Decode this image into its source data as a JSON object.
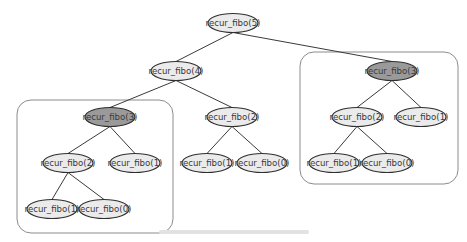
{
  "diagram": {
    "colors": {
      "node_fill": "#ebebeb",
      "node_stroke": "#2f2f2f",
      "highlight_fill": "#9a9a9a",
      "edge": "#3a3a3a",
      "group_stroke": "#8c8c8c"
    },
    "nodes": [
      {
        "id": "n5",
        "label": "recur_fibo(5)",
        "highlight": false
      },
      {
        "id": "n4",
        "label": "recur_fibo(4)",
        "highlight": false
      },
      {
        "id": "n3a",
        "label": "recur_fibo(3)",
        "highlight": true
      },
      {
        "id": "n2a",
        "label": "recur_fibo(2)",
        "highlight": false
      },
      {
        "id": "n1a",
        "label": "recur_fibo(1)",
        "highlight": false
      },
      {
        "id": "n1b",
        "label": "recur_fibo(1)",
        "highlight": false
      },
      {
        "id": "n0a",
        "label": "recur_fibo(0)",
        "highlight": false
      },
      {
        "id": "n2b",
        "label": "recur_fibo(2)",
        "highlight": false
      },
      {
        "id": "n1c",
        "label": "recur_fibo(1)",
        "highlight": false
      },
      {
        "id": "n0b",
        "label": "recur_fibo(0)",
        "highlight": false
      },
      {
        "id": "n3b",
        "label": "recur_fibo(3)",
        "highlight": true
      },
      {
        "id": "n2c",
        "label": "recur_fibo(2)",
        "highlight": false
      },
      {
        "id": "n1d",
        "label": "recur_fibo(1)",
        "highlight": false
      },
      {
        "id": "n1e",
        "label": "recur_fibo(1)",
        "highlight": false
      },
      {
        "id": "n0c",
        "label": "recur_fibo(0)",
        "highlight": false
      }
    ],
    "edges": [
      [
        "n5",
        "n4"
      ],
      [
        "n5",
        "n3b"
      ],
      [
        "n4",
        "n3a"
      ],
      [
        "n4",
        "n2b"
      ],
      [
        "n3a",
        "n2a"
      ],
      [
        "n3a",
        "n1a"
      ],
      [
        "n2a",
        "n1b"
      ],
      [
        "n2a",
        "n0a"
      ],
      [
        "n2b",
        "n1c"
      ],
      [
        "n2b",
        "n0b"
      ],
      [
        "n3b",
        "n2c"
      ],
      [
        "n3b",
        "n1d"
      ],
      [
        "n2c",
        "n1e"
      ],
      [
        "n2c",
        "n0c"
      ]
    ],
    "groups": [
      {
        "id": "dup-left",
        "members": [
          "n3a",
          "n2a",
          "n1a",
          "n1b",
          "n0a"
        ]
      },
      {
        "id": "dup-right",
        "members": [
          "n3b",
          "n2c",
          "n1d",
          "n1e",
          "n0c"
        ]
      }
    ]
  },
  "caption": {
    "text": "",
    "legible": false
  }
}
